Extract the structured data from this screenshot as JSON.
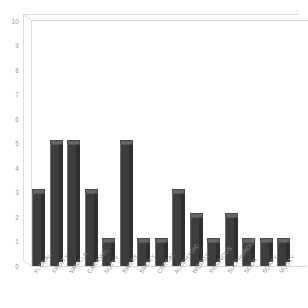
{
  "chart_data": {
    "type": "bar",
    "title": "",
    "subtitle": "",
    "xlabel": "",
    "ylabel": "",
    "categories": [
      "FLORAL",
      "FRUITY",
      "VANILLA",
      "CARAMEL",
      "NUTTY",
      "SWEET",
      "SMOKY",
      "CEREAL",
      "ALDEHYDIC",
      "WOODY",
      "RESINOUS",
      "SULPHUROUS",
      "SOUR",
      "SOAPY",
      "MUSTY"
    ],
    "values": [
      3,
      5,
      5,
      3,
      1,
      5,
      1,
      1,
      3,
      2,
      1,
      2,
      1,
      1,
      1
    ],
    "ylim": [
      0,
      10
    ],
    "yticks": [
      0,
      1,
      2,
      3,
      4,
      5,
      6,
      7,
      8,
      9,
      10
    ],
    "ytick_labels": [
      "0",
      "1",
      "2",
      "3",
      "4",
      "5",
      "6",
      "7",
      "8",
      "9",
      "10"
    ],
    "grid": false,
    "legend": false,
    "legend_position": "none",
    "bar_color": "#3d3d3d",
    "bar_top_color": "#666666",
    "bar_side_color": "#2f2f2f",
    "axis_color": "#9a9a9a",
    "frame_color": "#dedede",
    "background": "#ffffff",
    "style": "3d-column"
  }
}
